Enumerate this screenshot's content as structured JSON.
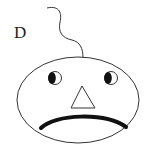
{
  "figure": {
    "label": "D",
    "colors": {
      "stroke": "#333333",
      "fill": "#ffffff",
      "pupil": "#111111"
    }
  }
}
